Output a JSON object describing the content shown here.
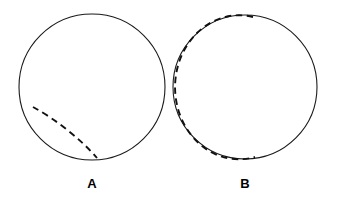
{
  "figure": {
    "background_color": "#ffffff",
    "width": 342,
    "height": 207,
    "stroke_color": "#1a1a1a",
    "arc_color": "#111111",
    "label_color": "#000000"
  },
  "panels": [
    {
      "id": "A",
      "label": "A",
      "label_x": 92,
      "label_y": 188,
      "circle": {
        "cx": 92,
        "cy": 87,
        "r": 73
      },
      "dashed_arc": {
        "description": "short dashed arc inside lower-left of circle",
        "dash_pattern": "6.5 4.5",
        "rx": 73,
        "ry": 20,
        "rotation": 38,
        "start_x": 33,
        "start_y": 107,
        "end_x": 97,
        "end_y": 158,
        "sweep": 1,
        "large_arc": 0
      }
    },
    {
      "id": "B",
      "label": "B",
      "label_x": 245,
      "label_y": 188,
      "circle": {
        "cx": 245,
        "cy": 87,
        "r": 72
      },
      "dashed_arc": {
        "description": "long dashed arc hugging inside of left half of circle",
        "dash_pattern": "6.5 4.5",
        "rx": 64,
        "ry": 72,
        "rotation": 0,
        "start_x": 253,
        "start_y": 17,
        "end_x": 255,
        "end_y": 157,
        "sweep": 0,
        "large_arc": 1
      }
    }
  ],
  "chart_data": {
    "type": "diagram",
    "title": "",
    "subtitle": "",
    "items": [
      {
        "label": "A",
        "shape": "circle",
        "radius_px": 73,
        "center_px": [
          92,
          87
        ],
        "inner_curve": "dashed arc, shallow, lower-left to bottom"
      },
      {
        "label": "B",
        "shape": "circle",
        "radius_px": 72,
        "center_px": [
          245,
          87
        ],
        "inner_curve": "dashed arc, deep, top-right around left side to bottom-right"
      }
    ],
    "legend": [],
    "grid": false
  }
}
